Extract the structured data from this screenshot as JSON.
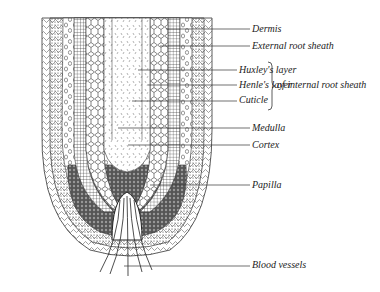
{
  "figure": {
    "labels": [
      {
        "id": "dermis",
        "text": "Dermis",
        "x": 252,
        "y": 24,
        "lineFrom": 166,
        "lineY": 29
      },
      {
        "id": "external-root-sheath",
        "text": "External root sheath",
        "x": 252,
        "y": 41,
        "lineFrom": 160,
        "lineY": 46
      },
      {
        "id": "huxleys-layer",
        "text": "Huxley's layer",
        "x": 239,
        "y": 65,
        "lineFrom": 138,
        "lineY": 70
      },
      {
        "id": "henles-layer",
        "text": "Henle's layer",
        "x": 239,
        "y": 80,
        "lineFrom": 148,
        "lineY": 85
      },
      {
        "id": "cuticle",
        "text": "Cuticle",
        "x": 239,
        "y": 95,
        "lineFrom": 132,
        "lineY": 101
      },
      {
        "id": "medulla",
        "text": "Medulla",
        "x": 252,
        "y": 123,
        "lineFrom": 118,
        "lineY": 128
      },
      {
        "id": "cortex",
        "text": "Cortex",
        "x": 252,
        "y": 140,
        "lineFrom": 128,
        "lineY": 145
      },
      {
        "id": "papilla",
        "text": "Papilla",
        "x": 252,
        "y": 180,
        "lineFrom": 150,
        "lineY": 185
      },
      {
        "id": "blood-vessels",
        "text": "Blood vessels",
        "x": 252,
        "y": 260,
        "lineFrom": 124,
        "lineY": 266
      }
    ],
    "group": {
      "text": "of internal root sheath",
      "x": 277,
      "y": 80,
      "braceX": 268,
      "braceTop": 62,
      "braceBottom": 110
    }
  }
}
